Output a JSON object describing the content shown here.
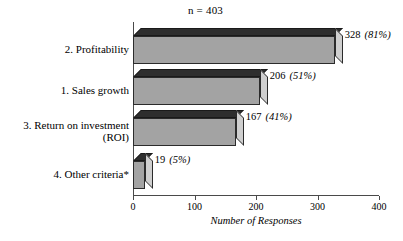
{
  "chart_data": {
    "type": "bar",
    "orientation": "horizontal",
    "title": "n = 403",
    "xlabel": "Number of Responses",
    "ylabel": "",
    "xlim": [
      0,
      400
    ],
    "xticks": [
      "0",
      "100",
      "200",
      "300",
      "400"
    ],
    "grid": false,
    "legend": null,
    "n": 403,
    "categories": [
      "2. Profitability",
      "1. Sales growth",
      "3. Return on investment\n(ROI)",
      "4. Other criteria*"
    ],
    "values": [
      328,
      206,
      167,
      19
    ],
    "percents": [
      "81%",
      "51%",
      "41%",
      "5%"
    ],
    "data_labels": [
      {
        "count": "328",
        "percent": "(81%)"
      },
      {
        "count": "206",
        "percent": "(51%)"
      },
      {
        "count": "167",
        "percent": "(41%)"
      },
      {
        "count": "19",
        "percent": "(5%)"
      }
    ],
    "colors": {
      "bar_front": "#a3a3a3",
      "bar_top": "#2e2e2e",
      "bar_side": "#cfcfcf",
      "axis": "#4a4a4a",
      "text": "#000000",
      "background": "#ffffff"
    }
  }
}
